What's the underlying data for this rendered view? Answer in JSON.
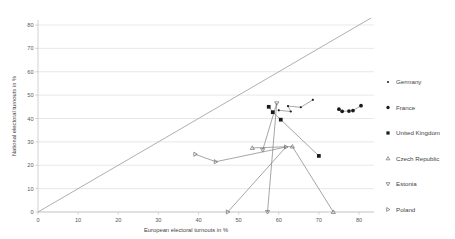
{
  "chart_data": {
    "type": "scatter",
    "title": "",
    "xlabel": "European electoral turnouts in %",
    "ylabel": "National electoral turnouts in %",
    "xlim": [
      0,
      85
    ],
    "ylim": [
      0,
      83
    ],
    "xticks": [
      0,
      10,
      20,
      30,
      40,
      50,
      60,
      70,
      80
    ],
    "yticks": [
      0,
      10,
      20,
      30,
      40,
      50,
      60,
      70,
      80
    ],
    "grid": "horizontal",
    "legend_position": "right",
    "reference_line": {
      "label": "y = x diagonal",
      "from": [
        0,
        0
      ],
      "to": [
        83,
        83
      ]
    },
    "series": [
      {
        "name": "Germany",
        "marker": "small-dot",
        "filled": true,
        "points": [
          {
            "x": 60.0,
            "y": 43.5
          },
          {
            "x": 63.0,
            "y": 43.0
          },
          {
            "x": 62.3,
            "y": 45.3
          },
          {
            "x": 65.5,
            "y": 44.8
          },
          {
            "x": 68.5,
            "y": 48.0
          }
        ]
      },
      {
        "name": "France",
        "marker": "circle",
        "filled": true,
        "points": [
          {
            "x": 75.0,
            "y": 44.0
          },
          {
            "x": 75.8,
            "y": 43.1
          },
          {
            "x": 77.5,
            "y": 43.2
          },
          {
            "x": 78.5,
            "y": 43.4
          },
          {
            "x": 80.5,
            "y": 45.5
          }
        ]
      },
      {
        "name": "United Kingdom",
        "marker": "square",
        "filled": true,
        "points": [
          {
            "x": 57.5,
            "y": 45.0
          },
          {
            "x": 58.5,
            "y": 42.7
          },
          {
            "x": 60.5,
            "y": 39.5
          },
          {
            "x": 70.0,
            "y": 24.0
          }
        ]
      },
      {
        "name": "Czech Republic",
        "marker": "triangle-up",
        "filled": false,
        "points": [
          {
            "x": 53.4,
            "y": 27.4
          },
          {
            "x": 63.4,
            "y": 28.0
          },
          {
            "x": 73.6,
            "y": 0.0
          }
        ]
      },
      {
        "name": "Estonia",
        "marker": "triangle-down",
        "filled": false,
        "points": [
          {
            "x": 56.0,
            "y": 26.5
          },
          {
            "x": 59.5,
            "y": 46.5
          },
          {
            "x": 57.2,
            "y": 0.0
          }
        ]
      },
      {
        "name": "Poland",
        "marker": "triangle-right",
        "filled": false,
        "points": [
          {
            "x": 39.2,
            "y": 24.7
          },
          {
            "x": 44.3,
            "y": 21.5
          },
          {
            "x": 61.8,
            "y": 27.8
          },
          {
            "x": 47.3,
            "y": 0.0
          }
        ]
      }
    ]
  },
  "axes": {
    "x_title": "European electoral turnouts in %",
    "y_title": "National electoral turnouts in %",
    "x_tick_labels": [
      "0",
      "10",
      "20",
      "30",
      "40",
      "50",
      "60",
      "70",
      "80"
    ],
    "y_tick_labels": [
      "0",
      "10",
      "20",
      "30",
      "40",
      "50",
      "60",
      "70",
      "80"
    ]
  },
  "legend": {
    "items": [
      {
        "label": "Germany",
        "marker": "small-dot"
      },
      {
        "label": "France",
        "marker": "circle"
      },
      {
        "label": "United Kingdom",
        "marker": "square"
      },
      {
        "label": "Czech Republic",
        "marker": "triangle-up"
      },
      {
        "label": "Estonia",
        "marker": "triangle-down"
      },
      {
        "label": "Poland",
        "marker": "triangle-right"
      }
    ]
  },
  "colors": {
    "marker_fill": "#1a1a1a",
    "marker_stroke": "#6b6b6b",
    "grid": "#d9d9d9",
    "axis": "#bfbfbf",
    "reference_line": "#a6a6a6",
    "text": "#3f3f3f",
    "background": "#ffffff"
  }
}
